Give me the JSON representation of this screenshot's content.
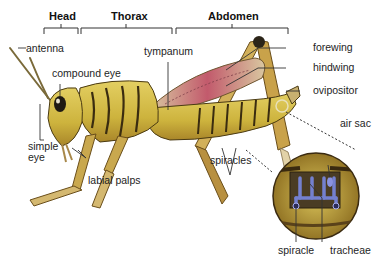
{
  "diagram": {
    "section_headers": [
      {
        "label": "Head"
      },
      {
        "label": "Thorax"
      },
      {
        "label": "Abdomen"
      }
    ],
    "labels": {
      "antenna": "antenna",
      "compound_eye": "compound eye",
      "simple_eye": "simple\neye",
      "labial_palps": "labial palps",
      "tympanum": "tympanum",
      "forewing": "forewing",
      "hindwing": "hindwing",
      "ovipositor": "ovipositor",
      "spiracles": "spiracles",
      "air_sac": "air sac",
      "spiracle": "spiracle",
      "tracheae": "tracheae"
    },
    "colors": {
      "body_yellow": "#d8c14a",
      "body_dark": "#3a2c10",
      "wing_red": "#b8475a",
      "wing_tan": "#d9c7a0",
      "trachea_blue": "#6f78c8",
      "leader_line": "#333333"
    }
  }
}
